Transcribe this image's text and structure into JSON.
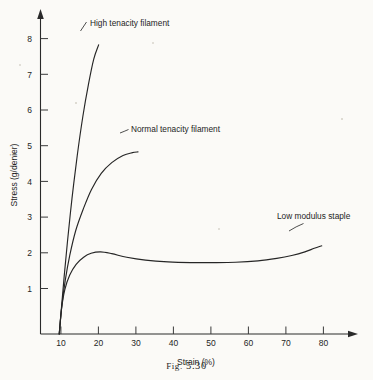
{
  "figure": {
    "caption_prefix": "Fig.",
    "caption_number": "5.30"
  },
  "chart_data": {
    "type": "line",
    "title": "",
    "xlabel": "Strain (%)",
    "ylabel": "Stress (g/denier)",
    "xlim": [
      0,
      90
    ],
    "ylim": [
      0,
      8.6
    ],
    "xticks": [
      10,
      20,
      30,
      40,
      50,
      60,
      70,
      80
    ],
    "yticks": [
      1,
      2,
      3,
      4,
      5,
      6,
      7,
      8
    ],
    "grid": false,
    "legend": "inline-annotations",
    "axis_arrows": true,
    "series": [
      {
        "name": "High tenacity filament",
        "label": "High tenacity filament",
        "x": [
          5.0,
          5.6,
          6.3,
          7.2,
          8.4,
          9.8,
          11.3,
          12.8,
          14.2,
          15.5
        ],
        "y": [
          0.0,
          0.75,
          1.6,
          2.6,
          3.8,
          5.0,
          6.1,
          7.0,
          7.7,
          8.1
        ]
      },
      {
        "name": "Normal tenacity filament",
        "label": "Normal tenacity filament",
        "x": [
          5.0,
          5.7,
          6.6,
          7.8,
          9.4,
          11.4,
          13.6,
          16.2,
          19.0,
          22.0,
          24.5,
          26.0
        ],
        "y": [
          0.0,
          0.8,
          1.5,
          2.2,
          2.9,
          3.5,
          4.05,
          4.5,
          4.8,
          5.0,
          5.08,
          5.1
        ]
      },
      {
        "name": "Low modulus staple",
        "label": "Low modulus staple",
        "x": [
          5.0,
          5.6,
          6.5,
          7.8,
          9.5,
          11.5,
          13.5,
          16.0,
          19.0,
          23.0,
          28.0,
          34.0,
          40.0,
          46.0,
          52.0,
          58.0,
          63.0,
          67.0,
          70.5,
          73.0,
          75.0
        ],
        "y": [
          0.0,
          0.7,
          1.25,
          1.65,
          1.95,
          2.15,
          2.26,
          2.3,
          2.25,
          2.15,
          2.07,
          2.02,
          2.0,
          2.0,
          2.01,
          2.05,
          2.12,
          2.2,
          2.3,
          2.4,
          2.47
        ]
      }
    ]
  }
}
